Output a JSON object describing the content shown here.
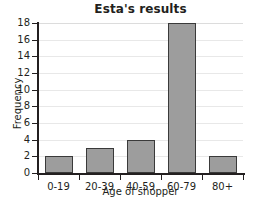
{
  "chart_data": {
    "type": "bar",
    "title": "Esta's results",
    "xlabel": "Age of shopper",
    "ylabel": "Frequency",
    "categories": [
      "0-19",
      "20-39",
      "40-59",
      "60-79",
      "80+"
    ],
    "values": [
      2,
      3,
      4,
      18,
      2
    ],
    "ylim": [
      0,
      18
    ],
    "ytick_values": [
      0,
      2,
      4,
      6,
      8,
      10,
      12,
      14,
      16,
      18
    ],
    "ytick_labels": [
      "0",
      "2",
      "4",
      "6",
      "8",
      "10",
      "12",
      "14",
      "16",
      "18"
    ],
    "grid": "horizontal",
    "legend": "none",
    "bar_color": "#9d9d9d",
    "bar_border_color": "#3a3a3a",
    "axis_color": "#231f20",
    "grid_color": "#e8e8e8",
    "background": "#ffffff"
  }
}
